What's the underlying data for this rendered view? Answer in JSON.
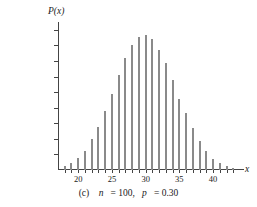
{
  "chart_data": {
    "type": "bar",
    "title": "",
    "subtitle": "",
    "caption": "(c)  n = 100, p = 0.30",
    "caption_parts": {
      "index": "(c)",
      "n_symbol": "n",
      "n_value": "= 100,",
      "p_symbol": "p",
      "p_value": "= 0.30"
    },
    "xlabel": "x",
    "ylabel": "P(x)",
    "xlim": [
      17,
      44
    ],
    "ylim": [
      0,
      0.095
    ],
    "grid": false,
    "legend": null,
    "x_ticks": [
      20,
      25,
      30,
      35,
      40
    ],
    "x_tick_labels": [
      "20",
      "25",
      "30",
      "35",
      "40"
    ],
    "x_minor_ticks": [
      18,
      19,
      20,
      21,
      22,
      23,
      24,
      25,
      26,
      27,
      28,
      29,
      30,
      31,
      32,
      33,
      34,
      35,
      36,
      37,
      38,
      39,
      40,
      41,
      42,
      43
    ],
    "y_ticks": [
      0.01,
      0.02,
      0.03,
      0.04,
      0.05,
      0.06,
      0.07,
      0.08,
      0.09
    ],
    "y_tick_labels": [
      "0.01",
      "0.02",
      "0.03",
      "0.04",
      "0.05",
      "0.06",
      "0.07",
      "0.08",
      "0.09"
    ],
    "bar_color": "#8a8a8a",
    "axis_color": "#444444",
    "distribution": "binomial",
    "parameters": {
      "n": 100,
      "p": 0.3
    },
    "categories": [
      18,
      19,
      20,
      21,
      22,
      23,
      24,
      25,
      26,
      27,
      28,
      29,
      30,
      31,
      32,
      33,
      34,
      35,
      36,
      37,
      38,
      39,
      40,
      41,
      42,
      43
    ],
    "values": [
      0.0026,
      0.0045,
      0.0076,
      0.012,
      0.018,
      0.0255,
      0.0342,
      0.0434,
      0.0521,
      0.0592,
      0.0639,
      0.0659,
      0.065,
      0.061,
      0.0546,
      0.0465,
      0.0378,
      0.0295,
      0.0221,
      0.0159,
      0.011,
      0.0073,
      0.0047,
      0.0029,
      0.0017,
      0.001
    ],
    "values_plotted": [
      0.0026,
      0.0045,
      0.0076,
      0.012,
      0.0199,
      0.0275,
      0.038,
      0.0491,
      0.0611,
      0.0716,
      0.08,
      0.0855,
      0.0868,
      0.084,
      0.0771,
      0.069,
      0.0578,
      0.0459,
      0.0366,
      0.0268,
      0.0189,
      0.0121,
      0.007,
      0.0044,
      0.0026,
      0.0012
    ],
    "peak_x": 30,
    "peak_value": 0.0868
  }
}
